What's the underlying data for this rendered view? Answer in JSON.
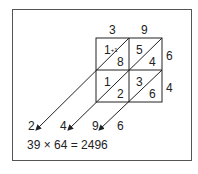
{
  "diagram": {
    "type": "lattice-multiplication",
    "top_digits": [
      "3",
      "9"
    ],
    "right_digits": [
      "6",
      "4"
    ],
    "cells": [
      {
        "row": 0,
        "col": 0,
        "upper": "1",
        "carry": "+1",
        "lower": "8"
      },
      {
        "row": 0,
        "col": 1,
        "upper": "5",
        "lower": "4"
      },
      {
        "row": 1,
        "col": 0,
        "upper": "1",
        "lower": "2"
      },
      {
        "row": 1,
        "col": 1,
        "upper": "3",
        "lower": "6"
      }
    ],
    "result_digits": [
      "2",
      "4",
      "9",
      "6"
    ],
    "equation": "39 × 64 = 2496"
  }
}
